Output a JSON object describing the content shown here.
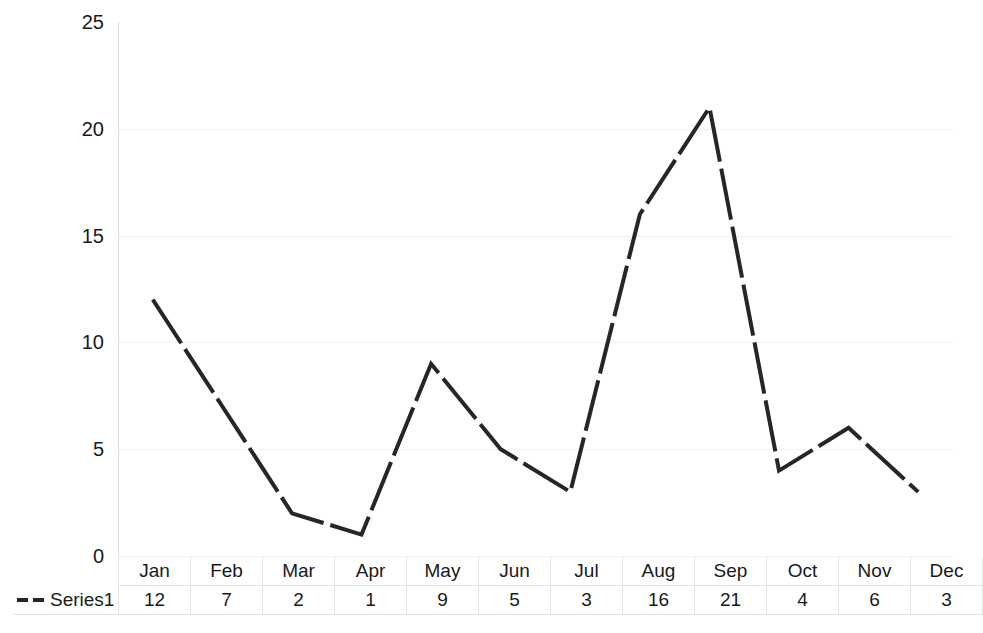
{
  "chart_data": {
    "type": "line",
    "title": "",
    "subtitle": "",
    "xlabel": "",
    "ylabel": "",
    "categories": [
      "Jan",
      "Feb",
      "Mar",
      "Apr",
      "May",
      "Jun",
      "Jul",
      "Aug",
      "Sep",
      "Oct",
      "Nov",
      "Dec"
    ],
    "series": [
      {
        "name": "Series1",
        "values": [
          12,
          7,
          2,
          1,
          9,
          5,
          3,
          16,
          21,
          4,
          6,
          3
        ],
        "color": "#262626",
        "line_style": "dashed",
        "line_width": 4
      }
    ],
    "ylim": [
      0,
      25
    ],
    "y_ticks": [
      0,
      5,
      10,
      15,
      20,
      25
    ],
    "y_tick_labels": [
      "0",
      "5",
      "10",
      "15",
      "20",
      "25"
    ],
    "grid": true,
    "grid_color": "#f3f3f3",
    "legend_position": "bottom-left",
    "data_table_visible": true,
    "markers": false
  },
  "legend": {
    "series1_label": "Series1",
    "marker_icon": "dashed-line-icon"
  },
  "table": {
    "row_header_label": "Series1",
    "columns": [
      "Jan",
      "Feb",
      "Mar",
      "Apr",
      "May",
      "Jun",
      "Jul",
      "Aug",
      "Sep",
      "Oct",
      "Nov",
      "Dec"
    ],
    "values": [
      "12",
      "7",
      "2",
      "1",
      "9",
      "5",
      "3",
      "16",
      "21",
      "4",
      "6",
      "3"
    ]
  },
  "axis": {
    "y_labels": [
      "25",
      "20",
      "15",
      "10",
      "5",
      "0"
    ]
  }
}
